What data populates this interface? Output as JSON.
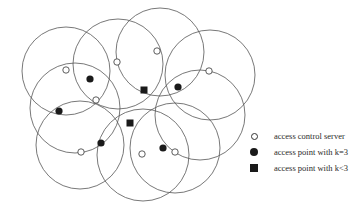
{
  "diagram": {
    "circles": [
      {
        "cx": 66,
        "cy": 71,
        "r": 44
      },
      {
        "cx": 118,
        "cy": 64,
        "r": 45
      },
      {
        "cx": 160,
        "cy": 52,
        "r": 44
      },
      {
        "cx": 210,
        "cy": 75,
        "r": 45
      },
      {
        "cx": 75,
        "cy": 108,
        "r": 45
      },
      {
        "cx": 80,
        "cy": 145,
        "r": 44
      },
      {
        "cx": 143,
        "cy": 155,
        "r": 46
      },
      {
        "cx": 175,
        "cy": 148,
        "r": 45
      },
      {
        "cx": 200,
        "cy": 115,
        "r": 45
      }
    ],
    "access_control_servers": [
      {
        "x": 66,
        "y": 70
      },
      {
        "x": 96,
        "y": 100
      },
      {
        "x": 117,
        "y": 62
      },
      {
        "x": 157,
        "y": 51
      },
      {
        "x": 209,
        "y": 71
      },
      {
        "x": 81,
        "y": 152
      },
      {
        "x": 142,
        "y": 154
      },
      {
        "x": 175,
        "y": 152
      }
    ],
    "access_points_k3": [
      {
        "x": 90,
        "y": 79
      },
      {
        "x": 59,
        "y": 111
      },
      {
        "x": 101,
        "y": 143
      },
      {
        "x": 178,
        "y": 87
      },
      {
        "x": 163,
        "y": 148
      }
    ],
    "access_points_klt3": [
      {
        "x": 144,
        "y": 90
      },
      {
        "x": 130,
        "y": 123
      }
    ],
    "colors": {
      "stroke": "#555555",
      "fill": "#1a1a1a",
      "background": "#ffffff"
    }
  },
  "legend": {
    "items": [
      {
        "symbol": "open-circle",
        "label": "access control server"
      },
      {
        "symbol": "filled-circle",
        "label": "access point with k=3"
      },
      {
        "symbol": "filled-square",
        "label": "access point with k<3"
      }
    ]
  }
}
